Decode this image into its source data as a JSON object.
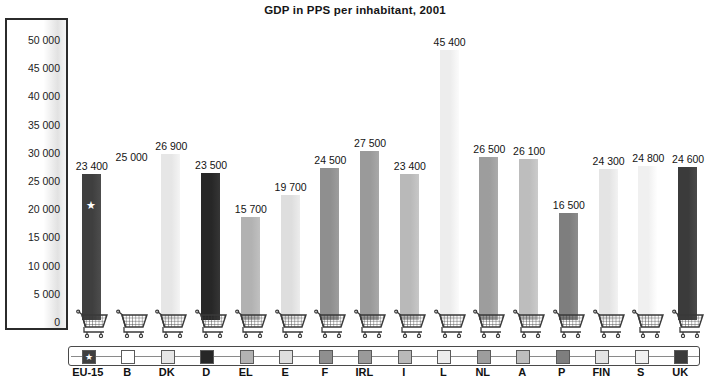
{
  "chart_data": {
    "type": "bar",
    "title": "GDP in PPS per inhabitant, 2001",
    "xlabel": "",
    "ylabel": "",
    "ylim": [
      0,
      50000
    ],
    "grid": false,
    "legend_position": "bottom",
    "categories": [
      "EU-15",
      "B",
      "DK",
      "D",
      "EL",
      "E",
      "F",
      "IRL",
      "I",
      "L",
      "NL",
      "A",
      "P",
      "FIN",
      "S",
      "UK"
    ],
    "values": [
      23400,
      25000,
      26900,
      23500,
      15700,
      19700,
      24500,
      27500,
      23400,
      45400,
      26500,
      26100,
      16500,
      24300,
      24800,
      24600
    ],
    "value_labels": [
      "23 400",
      "25 000",
      "26 900",
      "23 500",
      "15 700",
      "19 700",
      "24 500",
      "27 500",
      "23 400",
      "45 400",
      "26 500",
      "26 100",
      "16 500",
      "24 300",
      "24 800",
      "24 600"
    ],
    "bar_colors": [
      "#3f3f3f",
      "#ffffff",
      "#e6e6e6",
      "#272727",
      "#b2b2b2",
      "#dedede",
      "#8f8f8f",
      "#9a9a9a",
      "#b9b9b9",
      "#ededed",
      "#9d9d9d",
      "#bdbdbd",
      "#7e7e7e",
      "#e4e4e4",
      "#f0f0f0",
      "#3b3b3b"
    ],
    "y_ticks": [
      0,
      5000,
      10000,
      15000,
      20000,
      25000,
      30000,
      35000,
      40000,
      45000,
      50000
    ],
    "y_tick_labels": [
      "0",
      "5 000",
      "10 000",
      "15 000",
      "20 000",
      "25 000",
      "30 000",
      "35 000",
      "40 000",
      "45 000",
      "50 000"
    ],
    "marker_note": "white star marks EU-15"
  },
  "legend": {
    "entries": [
      {
        "label": "EU-15",
        "color": "#3f3f3f",
        "star": "★"
      },
      {
        "label": "B",
        "color": "#ffffff",
        "star": ""
      },
      {
        "label": "DK",
        "color": "#e6e6e6",
        "star": ""
      },
      {
        "label": "D",
        "color": "#272727",
        "star": ""
      },
      {
        "label": "EL",
        "color": "#b2b2b2",
        "star": ""
      },
      {
        "label": "E",
        "color": "#dedede",
        "star": ""
      },
      {
        "label": "F",
        "color": "#8f8f8f",
        "star": ""
      },
      {
        "label": "IRL",
        "color": "#9a9a9a",
        "star": ""
      },
      {
        "label": "I",
        "color": "#b9b9b9",
        "star": ""
      },
      {
        "label": "L",
        "color": "#ededed",
        "star": ""
      },
      {
        "label": "NL",
        "color": "#9d9d9d",
        "star": ""
      },
      {
        "label": "A",
        "color": "#bdbdbd",
        "star": ""
      },
      {
        "label": "P",
        "color": "#7e7e7e",
        "star": ""
      },
      {
        "label": "FIN",
        "color": "#e4e4e4",
        "star": ""
      },
      {
        "label": "S",
        "color": "#f0f0f0",
        "star": ""
      },
      {
        "label": "UK",
        "color": "#3b3b3b",
        "star": ""
      }
    ]
  },
  "icons": {
    "cart": "shopping-cart-icon",
    "star": "★"
  }
}
